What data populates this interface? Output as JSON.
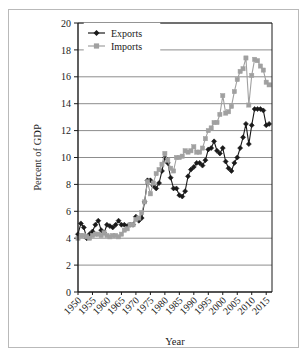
{
  "chart_data": {
    "type": "line",
    "title": "",
    "xlabel": "Year",
    "ylabel": "Percent of GDP",
    "xlim": [
      1950,
      2017
    ],
    "ylim": [
      0,
      20
    ],
    "ytick_step": 2,
    "xtick_step": 5,
    "grid": "horizontal",
    "legend_position": "top-left",
    "ytick_labels": [
      "0",
      "2",
      "4",
      "6",
      "8",
      "10",
      "12",
      "14",
      "16",
      "18",
      "20"
    ],
    "xtick_labels": [
      "1950",
      "1955",
      "1960",
      "1965",
      "1970",
      "1975",
      "1980",
      "1985",
      "1990",
      "1995",
      "2000",
      "2005",
      "2010",
      "2015"
    ],
    "x": [
      1950,
      1951,
      1952,
      1953,
      1954,
      1955,
      1956,
      1957,
      1958,
      1959,
      1960,
      1961,
      1962,
      1963,
      1964,
      1965,
      1966,
      1967,
      1968,
      1969,
      1970,
      1971,
      1972,
      1973,
      1974,
      1975,
      1976,
      1977,
      1978,
      1979,
      1980,
      1981,
      1982,
      1983,
      1984,
      1985,
      1986,
      1987,
      1988,
      1989,
      1990,
      1991,
      1992,
      1993,
      1994,
      1995,
      1996,
      1997,
      1998,
      1999,
      2000,
      2001,
      2002,
      2003,
      2004,
      2005,
      2006,
      2007,
      2008,
      2009,
      2010,
      2011,
      2012,
      2013,
      2014,
      2015,
      2016
    ],
    "series": [
      {
        "name": "Exports",
        "color": "#1a1a1a",
        "marker": "diamond",
        "values": [
          4.3,
          5.1,
          4.8,
          4.0,
          4.3,
          4.5,
          5.0,
          5.3,
          4.6,
          4.4,
          5.0,
          4.9,
          4.8,
          5.0,
          5.3,
          5.0,
          5.0,
          4.9,
          5.0,
          5.0,
          5.6,
          5.3,
          5.5,
          6.7,
          8.3,
          8.3,
          7.9,
          7.7,
          8.1,
          9.0,
          10.0,
          9.6,
          8.5,
          7.7,
          7.7,
          7.2,
          7.1,
          7.5,
          8.6,
          9.1,
          9.3,
          9.6,
          9.6,
          9.4,
          9.8,
          10.6,
          10.7,
          11.2,
          10.5,
          10.3,
          10.7,
          9.7,
          9.2,
          9.0,
          9.6,
          10.0,
          10.7,
          11.5,
          12.5,
          11.0,
          12.4,
          13.6,
          13.6,
          13.6,
          13.5,
          12.4,
          12.5
        ]
      },
      {
        "name": "Imports",
        "color": "#a0a0a0",
        "marker": "square",
        "values": [
          4.0,
          4.2,
          4.2,
          4.1,
          4.0,
          4.2,
          4.3,
          4.3,
          4.2,
          4.4,
          4.2,
          4.1,
          4.2,
          4.2,
          4.1,
          4.3,
          4.6,
          4.7,
          5.0,
          5.0,
          5.4,
          5.5,
          5.9,
          6.7,
          8.2,
          7.3,
          8.1,
          8.8,
          9.1,
          9.5,
          10.3,
          9.8,
          9.2,
          9.0,
          10.0,
          10.0,
          10.1,
          10.5,
          10.4,
          10.5,
          10.8,
          10.4,
          10.4,
          10.7,
          11.4,
          12.0,
          12.2,
          12.6,
          12.6,
          13.2,
          14.6,
          13.3,
          13.4,
          13.8,
          14.9,
          15.8,
          16.4,
          16.6,
          17.4,
          13.9,
          16.1,
          17.3,
          17.2,
          16.8,
          16.5,
          15.6,
          15.4
        ]
      }
    ]
  },
  "legend": {
    "items": [
      {
        "label": "Exports"
      },
      {
        "label": "Imports"
      }
    ]
  },
  "axes": {
    "x_title": "Year",
    "y_title": "Percent of GDP"
  },
  "colors": {
    "exports": "#1a1a1a",
    "imports": "#a0a0a0",
    "grid": "#8d8d8d",
    "frame": "#b9b9b9",
    "axis": "#1a1a1a"
  }
}
